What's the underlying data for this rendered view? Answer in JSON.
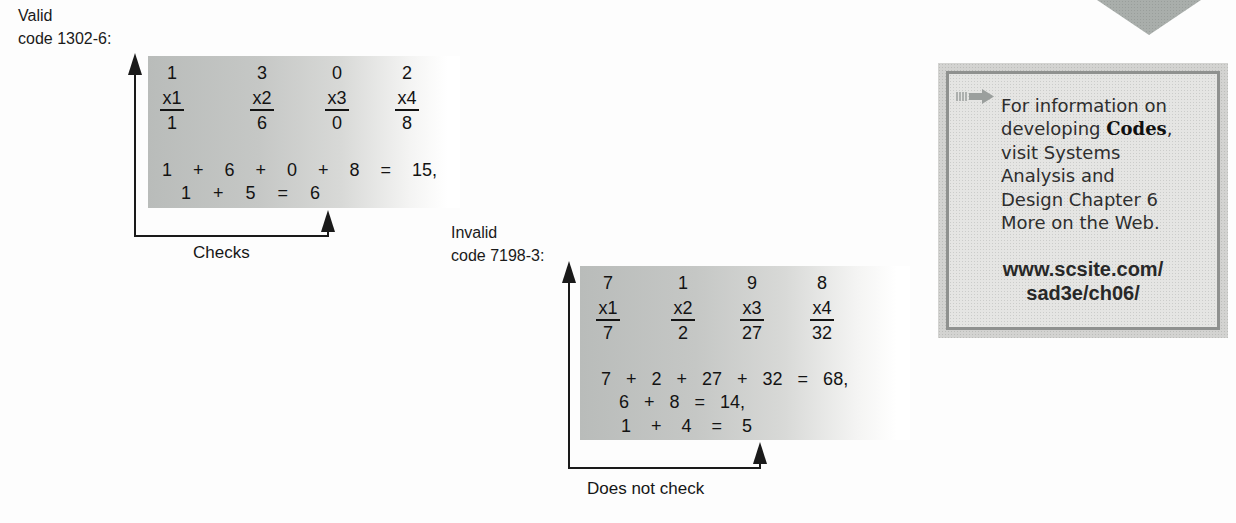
{
  "examples": {
    "valid": {
      "label": {
        "line1": "Valid",
        "line2": "code 1302-6:"
      },
      "columns": [
        {
          "digit": "1",
          "multiplier": "x1",
          "product": "1"
        },
        {
          "digit": "3",
          "multiplier": "x2",
          "product": "6"
        },
        {
          "digit": "0",
          "multiplier": "x3",
          "product": "0"
        },
        {
          "digit": "2",
          "multiplier": "x4",
          "product": "8"
        }
      ],
      "sums": {
        "line1": "1 + 6 + 0 + 8 = 15,",
        "line2": "1 + 5 = 6"
      },
      "result_label": "Checks"
    },
    "invalid": {
      "label": {
        "line1": "Invalid",
        "line2": "code 7198-3:"
      },
      "columns": [
        {
          "digit": "7",
          "multiplier": "x1",
          "product": "7"
        },
        {
          "digit": "1",
          "multiplier": "x2",
          "product": "2"
        },
        {
          "digit": "9",
          "multiplier": "x3",
          "product": "27"
        },
        {
          "digit": "8",
          "multiplier": "x4",
          "product": "32"
        }
      ],
      "sums": {
        "line1": "7 + 2 + 27 + 32 = 68,",
        "line2": "6 + 8 = 14,",
        "line3": "1 + 4 = 5"
      },
      "result_label": "Does not check"
    }
  },
  "sidebar": {
    "icon": "hatched-right-arrow",
    "lines": {
      "l1": "For information on",
      "l2": {
        "pre": "developing ",
        "bold": "Codes",
        "post": ","
      },
      "l3": "visit Systems",
      "l4": "Analysis and",
      "l5": "Design Chapter 6",
      "l6": "More on the Web."
    },
    "url": {
      "line1": "www.scsite.com/",
      "line2": "sad3e/ch06/"
    }
  },
  "colors": {
    "box_gray": "#c2c4c2",
    "panel_frame": "#d3d3d1",
    "panel_border": "#8f918f",
    "panel_fill": "#e5e5e3",
    "corner_triangle": "#a9aeab",
    "arrow_black": "#1a1a1a"
  }
}
